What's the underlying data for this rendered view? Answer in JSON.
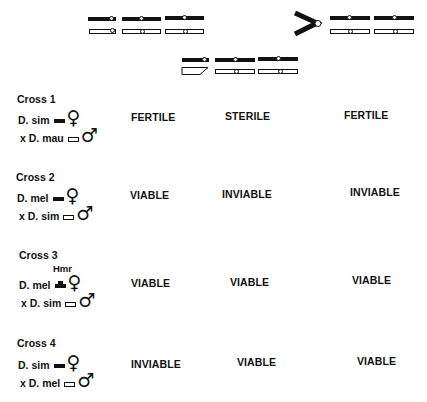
{
  "karyotype": {
    "description": "Chromosome schematic: X chromosome and autosomes; attached-X (compound) and Y arrangement",
    "row1_left": [
      "X",
      "2",
      "3"
    ],
    "row1_right_symbol": ">",
    "row1_right": [
      "2",
      "3"
    ],
    "row2": [
      "Y",
      "2",
      "3"
    ],
    "colors": {
      "dark_chromosome": "#111111",
      "light_chromosome": "#ffffff",
      "outline": "#111111"
    }
  },
  "crosses": [
    {
      "label": "Cross   1",
      "female_line": "D. sim",
      "male_line": "x D. mau",
      "hmr_label": "",
      "results": [
        "FERTILE",
        "STERILE",
        "FERTILE"
      ]
    },
    {
      "label": "Cross   2",
      "female_line": "D. mel",
      "male_line": "x D. sim",
      "hmr_label": "",
      "results": [
        "VIABLE",
        "INVIABLE",
        "INVIABLE"
      ]
    },
    {
      "label": "Cross   3",
      "female_line": "D. mel",
      "male_line": "x D. sim",
      "hmr_label": "Hmr",
      "results": [
        "VIABLE",
        "VIABLE",
        "VIABLE"
      ]
    },
    {
      "label": "Cross   4",
      "female_line": "D. sim",
      "male_line": "x D. mel",
      "hmr_label": "",
      "results": [
        "INVIABLE",
        "VIABLE",
        "VIABLE"
      ]
    }
  ],
  "symbols": {
    "female": "♀",
    "male": "♂"
  }
}
